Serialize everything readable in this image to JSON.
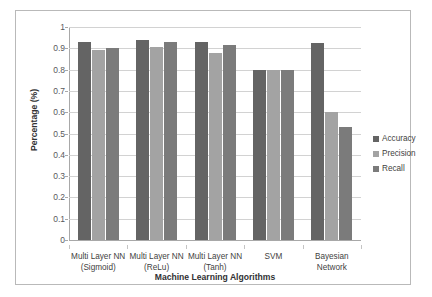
{
  "chart_data": {
    "type": "bar",
    "title": "",
    "xlabel": "Machine Learning Algorithms",
    "ylabel": "Percentage (%)",
    "ylim": [
      0,
      1
    ],
    "ytick_values": [
      1,
      0.9,
      0.8,
      0.7,
      0.6,
      0.5,
      0.4,
      0.3,
      0.2,
      0.1,
      0
    ],
    "ytick_labels": [
      "1",
      "0.9",
      "0.8",
      "0.7",
      "0.6",
      "0.5",
      "0.4",
      "0.3",
      "0.2",
      "0.1",
      "0"
    ],
    "grid": true,
    "legend_position": "right",
    "categories": [
      "Multi Layer NN\n(Sigmoid)",
      "Multi Layer NN\n(ReLu)",
      "Multi Layer NN\n(Tanh)",
      "SVM",
      "Bayesian\nNetwork"
    ],
    "category_lines": [
      [
        "Multi Layer NN",
        "(Sigmoid)"
      ],
      [
        "Multi Layer NN",
        "(ReLu)"
      ],
      [
        "Multi Layer NN",
        "(Tanh)"
      ],
      [
        "SVM",
        ""
      ],
      [
        "Bayesian",
        "Network"
      ]
    ],
    "series": [
      {
        "name": "Accuracy",
        "color": "#646464",
        "values": [
          0.93,
          0.94,
          0.93,
          0.8,
          0.925
        ]
      },
      {
        "name": "Precision",
        "color": "#a3a3a3",
        "values": [
          0.89,
          0.905,
          0.88,
          0.8,
          0.6
        ]
      },
      {
        "name": "Recall",
        "color": "#7b7b7b",
        "values": [
          0.9,
          0.93,
          0.915,
          0.8,
          0.53
        ]
      }
    ]
  },
  "legend": {
    "items": [
      {
        "label": "Accuracy"
      },
      {
        "label": "Precision"
      },
      {
        "label": "Recall"
      }
    ]
  },
  "colors": {
    "accuracy": "#646464",
    "precision": "#a3a3a3",
    "recall": "#7b7b7b",
    "grid": "#d2d2d2",
    "axis": "#a8a8a8",
    "border": "#b9b9b9",
    "background": "#ffffff"
  }
}
